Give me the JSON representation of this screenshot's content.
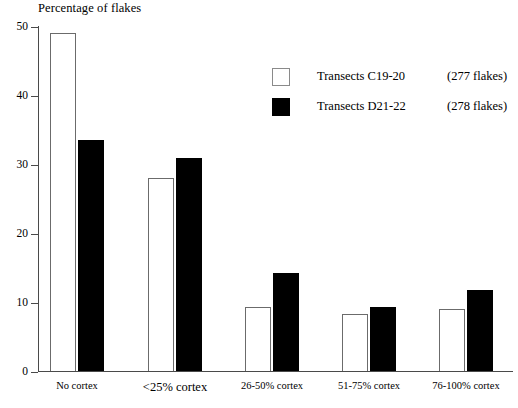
{
  "chart_data": {
    "type": "bar",
    "title": "Percentage of flakes",
    "xlabel": "",
    "ylabel": "Percentage of flakes",
    "ylim": [
      0,
      50
    ],
    "yticks": [
      0,
      10,
      20,
      30,
      40,
      50
    ],
    "grid": false,
    "legend_position": "upper-right-inside",
    "categories": [
      "No cortex",
      "<25% cortex",
      "26-50% cortex",
      "51-75% cortex",
      "76-100% cortex"
    ],
    "series": [
      {
        "name": "Transects C19-20",
        "legend_label": "Transects C19-20",
        "legend_count": "(277 flakes)",
        "sample_size": 277,
        "style": "open",
        "color": "#ffffff",
        "edge_color": "#6b6b6b",
        "values": [
          49.0,
          28.0,
          9.4,
          8.4,
          9.0
        ]
      },
      {
        "name": "Transects D21-22",
        "legend_label": "Transects D21-22",
        "legend_count": "(278 flakes)",
        "sample_size": 278,
        "style": "filled",
        "color": "#000000",
        "edge_color": "#000000",
        "values": [
          33.5,
          31.0,
          14.3,
          9.3,
          11.8
        ]
      }
    ]
  },
  "axis": {
    "tick_labels": [
      "50",
      "40",
      "30",
      "20",
      "10",
      "0"
    ],
    "tick_values": [
      50,
      40,
      30,
      20,
      10,
      0
    ]
  },
  "colors": {
    "background": "#ffffff",
    "axis": "#4a4a4a",
    "open_bar_fill": "#ffffff",
    "open_bar_edge": "#6b6b6b",
    "filled_bar": "#000000",
    "text": "#000000"
  }
}
